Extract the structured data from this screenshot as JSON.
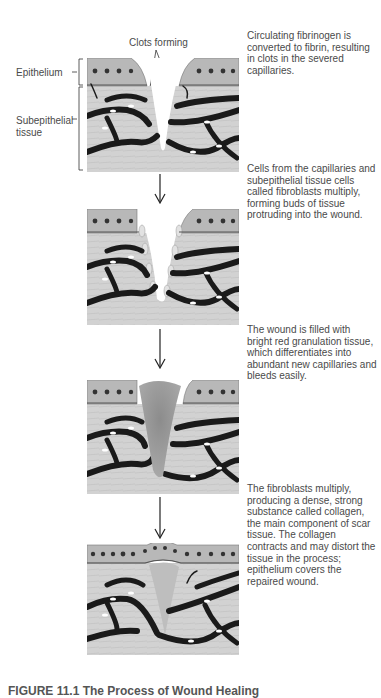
{
  "labels": {
    "clots_forming": "Clots forming",
    "epithelium": "Epithelium",
    "subepithelial_line1": "Subepithelial",
    "subepithelial_line2": "tissue"
  },
  "stages": [
    {
      "step": 1,
      "description": "Circulating fibrinogen is converted to fibrin, resulting in clots in the severed capillaries."
    },
    {
      "step": 2,
      "description": "Cells from the capillaries and subepithelial tissue cells called fibroblasts multiply, forming buds of tissue protruding into the wound."
    },
    {
      "step": 3,
      "description": "The wound is filled with bright red granulation tissue, which differentiates into abundant new capillaries and bleeds easily."
    },
    {
      "step": 4,
      "description": "The fibroblasts multiply, producing a dense, strong substance called collagen, the main component of scar tissue. The collagen contracts and may distort the tissue in the process; epithelium covers the repaired wound."
    }
  ],
  "caption": "FIGURE 11.1 The Process of Wound Healing",
  "colors": {
    "tissue": "#cfcfcf",
    "epithelium": "#b5b5b5",
    "vessel": "#1a1a1a",
    "granulation": "#9a9a9a"
  }
}
